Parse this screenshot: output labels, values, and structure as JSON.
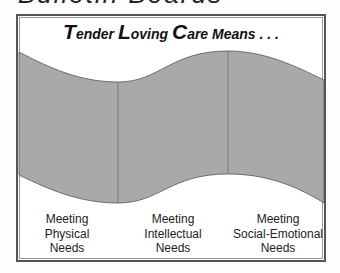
{
  "page_heading": "Bulletin Boards",
  "diagram": {
    "title": {
      "parts": [
        {
          "cap": "T",
          "rest": "ender "
        },
        {
          "cap": "L",
          "rest": "oving "
        },
        {
          "cap": "C",
          "rest": "are Means . . ."
        }
      ]
    },
    "band_color": "#a9a9a9",
    "sections": [
      {
        "line1": "Meeting",
        "line2": "Physical",
        "line3": "Needs"
      },
      {
        "line1": "Meeting",
        "line2": "Intellectual",
        "line3": "Needs"
      },
      {
        "line1": "Meeting",
        "line2": "Social-Emotional",
        "line3": "Needs"
      }
    ]
  }
}
